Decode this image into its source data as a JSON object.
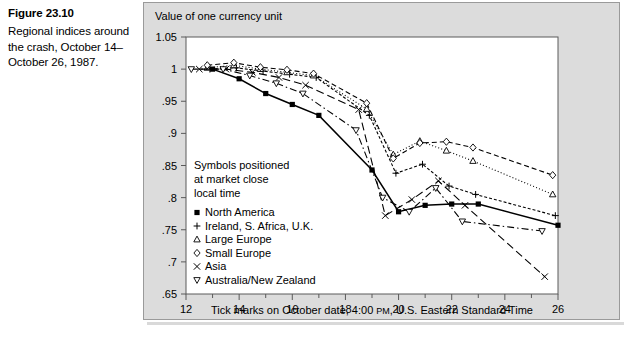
{
  "figure": {
    "number": "Figure 23.10",
    "caption": "Regional indices around the crash, October 14–October 26, 1987."
  },
  "chart_data": {
    "type": "line",
    "title": "",
    "ylabel": "Value of one currency unit",
    "xlabel": "Tick marks on October date, 4:00 PM, U.S. Eastern Standard Time",
    "xlabel_part1": "Tick marks on October date, 4:00 ",
    "xlabel_smallcaps": "PM",
    "xlabel_part2": ", U.S. Eastern Standard Time",
    "xlim": [
      12,
      26
    ],
    "ylim": [
      0.65,
      1.05
    ],
    "grid": false,
    "legend_position": "inside-left",
    "x_ticks": [
      12,
      14,
      16,
      18,
      20,
      22,
      24,
      26
    ],
    "x_tick_labels": [
      "12",
      "14",
      "16",
      "18",
      "20",
      "22",
      "24",
      "26"
    ],
    "x_minor_ticks": [
      13,
      15,
      17,
      19,
      21,
      23,
      25
    ],
    "y_ticks": [
      1.05,
      1.0,
      0.95,
      0.9,
      0.85,
      0.8,
      0.75,
      0.7,
      0.65
    ],
    "y_tick_labels": [
      "1.05",
      "1",
      ".95",
      ".9",
      ".85",
      ".8",
      ".75",
      ".7",
      ".65"
    ],
    "note": [
      "Symbols positioned",
      "at market close",
      "local time"
    ],
    "series": [
      {
        "name": "North America",
        "marker": "filled-square",
        "line": "solid",
        "x": [
          13.0,
          14.0,
          15.0,
          16.0,
          17.0,
          19.0,
          20.0,
          21.0,
          22.0,
          23.0,
          26.0
        ],
        "y": [
          1.0,
          0.985,
          0.962,
          0.945,
          0.928,
          0.843,
          0.778,
          0.788,
          0.79,
          0.79,
          0.757
        ]
      },
      {
        "name": "Ireland, S. Africa, U.K.",
        "marker": "plus",
        "line": "dotted-dashed",
        "x": [
          12.9,
          13.9,
          14.9,
          15.9,
          16.9,
          18.9,
          19.9,
          20.9,
          21.9,
          22.9,
          25.9
        ],
        "y": [
          1.0,
          1.002,
          0.997,
          0.992,
          0.987,
          0.928,
          0.838,
          0.852,
          0.818,
          0.805,
          0.772
        ]
      },
      {
        "name": "Large Europe",
        "marker": "triangle-up",
        "line": "dotted",
        "x": [
          12.8,
          13.8,
          14.8,
          15.8,
          16.8,
          18.8,
          19.8,
          20.8,
          21.8,
          22.8,
          25.8
        ],
        "y": [
          1.002,
          1.006,
          1.0,
          0.995,
          0.99,
          0.938,
          0.867,
          0.888,
          0.873,
          0.857,
          0.805
        ]
      },
      {
        "name": "Small Europe",
        "marker": "diamond",
        "line": "dashed",
        "x": [
          12.8,
          13.8,
          14.8,
          15.8,
          16.8,
          18.8,
          19.8,
          20.8,
          21.8,
          22.8,
          25.8
        ],
        "y": [
          1.006,
          1.01,
          1.003,
          0.999,
          0.993,
          0.947,
          0.861,
          0.885,
          0.887,
          0.878,
          0.835
        ]
      },
      {
        "name": "Asia",
        "marker": "cross",
        "line": "long-dash",
        "x": [
          12.5,
          13.5,
          14.5,
          15.5,
          16.5,
          18.5,
          19.5,
          20.5,
          21.5,
          22.5,
          25.5
        ],
        "y": [
          1.0,
          1.0,
          0.995,
          0.987,
          0.975,
          0.937,
          0.772,
          0.797,
          0.826,
          0.788,
          0.677
        ]
      },
      {
        "name": "Australia/New Zealand",
        "marker": "triangle-down",
        "line": "dash-dot",
        "x": [
          12.2,
          13.4,
          14.4,
          15.4,
          16.4,
          18.4,
          19.4,
          20.4,
          21.4,
          22.4,
          25.4
        ],
        "y": [
          1.0,
          1.0,
          0.99,
          0.978,
          0.962,
          0.905,
          0.8,
          0.778,
          0.815,
          0.763,
          0.748
        ]
      }
    ]
  },
  "legend": {
    "entries": [
      {
        "marker": "filled-square",
        "label": "North America"
      },
      {
        "marker": "plus",
        "label": "Ireland, S. Africa, U.K."
      },
      {
        "marker": "triangle-up",
        "label": "Large Europe"
      },
      {
        "marker": "diamond",
        "label": "Small Europe"
      },
      {
        "marker": "cross",
        "label": "Asia"
      },
      {
        "marker": "triangle-down",
        "label": "Australia/New Zealand"
      }
    ]
  },
  "colors": {
    "panel_background": "#dcdcdc",
    "plot_background": "#ffffff",
    "ink": "#000000",
    "panel_border": "#9a9a9a"
  }
}
